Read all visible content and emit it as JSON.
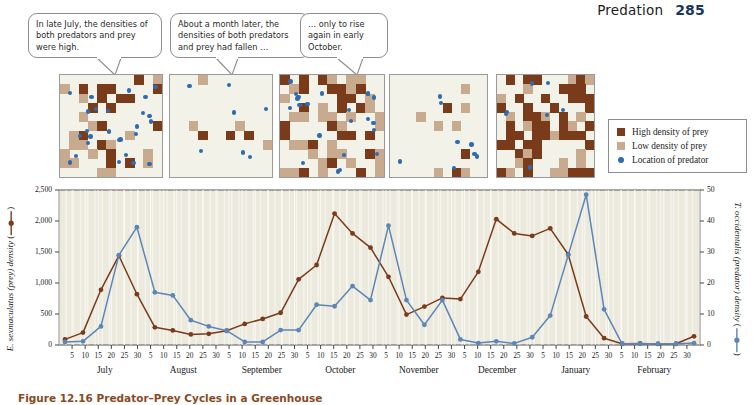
{
  "header": {
    "title": "Predation",
    "page_number": "285"
  },
  "caption": "Figure 12.16  Predator–Prey Cycles in a Greenhouse",
  "callouts": [
    {
      "id": "callout-1",
      "text": "In late July, the densities of both predators and prey were high."
    },
    {
      "id": "callout-2",
      "text": "About a month later, the densities of both predators and prey had fallen …"
    },
    {
      "id": "callout-3",
      "text": "… only to rise again in early October."
    }
  ],
  "legend": {
    "items": [
      {
        "label": "High density of prey",
        "marker": "square",
        "color": "#7a3b1b"
      },
      {
        "label": "Low density of prey",
        "marker": "square",
        "color": "#c8ab8e"
      },
      {
        "label": "Location of predator",
        "marker": "dot",
        "color": "#2f6bb0"
      }
    ]
  },
  "panels": [
    {
      "name": "panel-late-july"
    },
    {
      "name": "panel-late-august"
    },
    {
      "name": "panel-early-october"
    },
    {
      "name": "panel-november"
    },
    {
      "name": "panel-december"
    }
  ],
  "chart_data": {
    "type": "line",
    "title": "",
    "xlabel": "",
    "ylabel": "E. sexmaculatus (prey) density",
    "y2label": "T. occidentalis (predator) density",
    "ylim": [
      0,
      2500
    ],
    "y2lim": [
      0,
      50
    ],
    "yticks": [
      "0",
      "500",
      "1,000",
      "1,500",
      "2,000",
      "2,500"
    ],
    "y2ticks": [
      "0",
      "10",
      "20",
      "30",
      "40",
      "50"
    ],
    "grid": true,
    "legend_position": "axis-labels",
    "months": [
      "July",
      "August",
      "September",
      "October",
      "November",
      "December",
      "January",
      "February"
    ],
    "day_ticks": [
      5,
      10,
      15,
      20,
      25,
      30
    ],
    "x": [
      "Jul 5",
      "Jul 10",
      "Jul 18",
      "Jul 25",
      "Jul 31",
      "Aug 9",
      "Aug 13",
      "Aug 20",
      "Aug 26",
      "Sep 2",
      "Sep 9",
      "Sep 15",
      "Sep 22",
      "Sep 30",
      "Oct 6",
      "Oct 11",
      "Oct 18",
      "Oct 23",
      "Oct 30",
      "Nov 6",
      "Nov 13",
      "Nov 20",
      "Nov 27",
      "Dec 3",
      "Dec 11",
      "Dec 18",
      "Dec 25",
      "Jan 1",
      "Jan 9",
      "Jan 16",
      "Jan 22",
      "Jan 29",
      "Feb 5",
      "Feb 12",
      "Feb 19",
      "Feb 27"
    ],
    "series": [
      {
        "name": "E. sexmaculatus (prey) density",
        "axis": "left",
        "color": "#7a3b1b",
        "values": [
          90,
          200,
          890,
          1440,
          820,
          285,
          235,
          170,
          180,
          230,
          340,
          420,
          520,
          1060,
          1290,
          2120,
          1800,
          1570,
          1100,
          490,
          620,
          760,
          740,
          1180,
          2030,
          1800,
          1760,
          1880,
          1460,
          460,
          110,
          20,
          25,
          18,
          20,
          140
        ]
      },
      {
        "name": "T. occidentalis (predator) density",
        "axis": "right",
        "color": "#5c86b8",
        "values": [
          1.0,
          1.2,
          6.0,
          29.0,
          38.0,
          17.0,
          16.0,
          8.0,
          6.0,
          4.6,
          1.0,
          1.0,
          4.8,
          4.8,
          13.0,
          12.5,
          19.0,
          14.5,
          38.5,
          14.5,
          6.5,
          14.5,
          1.8,
          0.6,
          1.2,
          0.5,
          2.5,
          9.5,
          29.0,
          48.5,
          11.5,
          0.4,
          0.4,
          0.4,
          0.4,
          0.6
        ]
      }
    ]
  }
}
